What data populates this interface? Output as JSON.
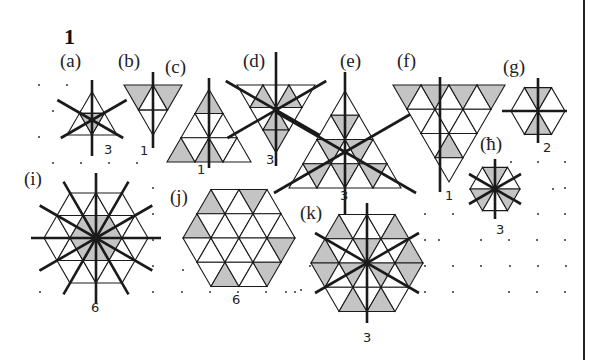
{
  "title": "1",
  "figures": [
    {
      "id": "a",
      "label": "(a)",
      "order": "3",
      "lx": 60,
      "ly": 50,
      "nx": 104,
      "ny": 142
    },
    {
      "id": "b",
      "label": "(b)",
      "order": "1",
      "lx": 118,
      "ly": 50,
      "nx": 140,
      "ny": 143
    },
    {
      "id": "c",
      "label": "(c)",
      "order": "1",
      "lx": 165,
      "ly": 56,
      "nx": 197,
      "ny": 162
    },
    {
      "id": "d",
      "label": "(d)",
      "order": "3",
      "lx": 243,
      "ly": 50,
      "nx": 266,
      "ny": 152
    },
    {
      "id": "e",
      "label": "(e)",
      "order": "3",
      "lx": 340,
      "ly": 50,
      "nx": 340,
      "ny": 188
    },
    {
      "id": "f",
      "label": "(f)",
      "order": "1",
      "lx": 397,
      "ly": 50,
      "nx": 445,
      "ny": 188
    },
    {
      "id": "g",
      "label": "(g)",
      "order": "2",
      "lx": 503,
      "ly": 56,
      "nx": 543,
      "ny": 140
    },
    {
      "id": "h",
      "label": "(ħ)",
      "order": "3",
      "lx": 480,
      "ly": 133,
      "nx": 496,
      "ny": 222
    },
    {
      "id": "i",
      "label": "(i)",
      "order": "6",
      "lx": 24,
      "ly": 168,
      "nx": 91,
      "ny": 300
    },
    {
      "id": "j",
      "label": "(j)",
      "order": "6",
      "lx": 170,
      "ly": 186,
      "nx": 232,
      "ny": 292
    },
    {
      "id": "k",
      "label": "(k)",
      "order": "3",
      "lx": 300,
      "ly": 202,
      "nx": 363,
      "ny": 330
    }
  ],
  "colors": {
    "shade": "#c4c4c4",
    "line": "#1a1a1a",
    "dot": "#333333"
  }
}
